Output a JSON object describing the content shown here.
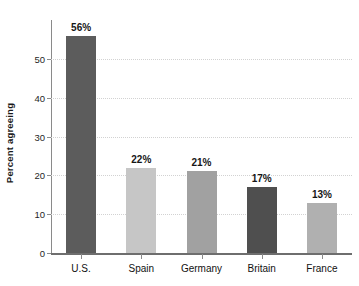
{
  "chart_data": {
    "type": "bar",
    "title": "",
    "xlabel": "",
    "ylabel": "Percent agreeing",
    "categories": [
      "U.S.",
      "Spain",
      "Germany",
      "Britain",
      "France"
    ],
    "values": [
      56,
      22,
      21,
      17,
      13
    ],
    "value_labels": [
      "56%",
      "22%",
      "21%",
      "17%",
      "13%"
    ],
    "bar_colors": [
      "#5c5c5c",
      "#c6c6c6",
      "#a1a1a1",
      "#4f4f4f",
      "#b0b0b0"
    ],
    "ylim": [
      0,
      60
    ],
    "y_ticks": [
      0,
      10,
      20,
      30,
      40,
      50
    ],
    "y_tick_labels": [
      "0",
      "10",
      "20",
      "30",
      "40",
      "50"
    ],
    "grid": true,
    "grid_axis": "y",
    "grid_style": "dotted",
    "grid_color": "#d2d2d2",
    "legend": false,
    "legend_position": "none",
    "axis_color": "#8a8a8a",
    "baseline_color": "#6e6e6e",
    "text_color": "#161616",
    "background": "#ffffff"
  }
}
